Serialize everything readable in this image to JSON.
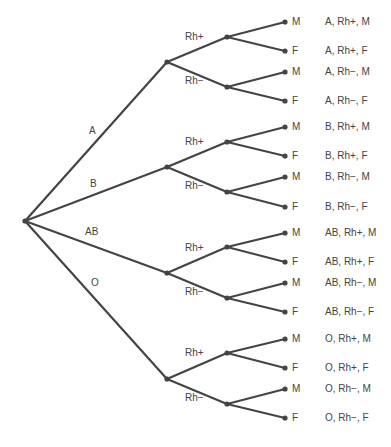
{
  "diagram": {
    "type": "tree",
    "root": {
      "x": 25,
      "y": 221
    },
    "line_color": "#444444",
    "groups": [
      {
        "label": "A",
        "label_pos": [
          89,
          131
        ],
        "node": [
          167,
          62
        ],
        "rh": [
          {
            "label": "Rh+",
            "label_pos": [
              185,
              37
            ],
            "node": [
              227,
              37
            ],
            "leaves": [
              {
                "sex": "M",
                "y": 22,
                "outcome": "A, Rh+, M"
              },
              {
                "sex": "F",
                "y": 51,
                "outcome": "A, Rh+, F"
              }
            ]
          },
          {
            "label": "Rh−",
            "label_pos": [
              185,
              81
            ],
            "node": [
              227,
              87
            ],
            "leaves": [
              {
                "sex": "M",
                "y": 72,
                "outcome": "A, Rh−, M"
              },
              {
                "sex": "F",
                "y": 101,
                "outcome": "A, Rh−, F"
              }
            ]
          }
        ]
      },
      {
        "label": "B",
        "label_pos": [
          90,
          184
        ],
        "node": [
          167,
          167
        ],
        "rh": [
          {
            "label": "Rh+",
            "label_pos": [
              185,
              142
            ],
            "node": [
              227,
              142
            ],
            "leaves": [
              {
                "sex": "M",
                "y": 127,
                "outcome": "B, Rh+, M"
              },
              {
                "sex": "F",
                "y": 156,
                "outcome": "B, Rh+, F"
              }
            ]
          },
          {
            "label": "Rh−",
            "label_pos": [
              185,
              186
            ],
            "node": [
              227,
              192
            ],
            "leaves": [
              {
                "sex": "M",
                "y": 177,
                "outcome": "B, Rh−, M"
              },
              {
                "sex": "F",
                "y": 207,
                "outcome": "B, Rh−, F"
              }
            ]
          }
        ]
      },
      {
        "label": "AB",
        "label_pos": [
          85,
          232
        ],
        "node": [
          167,
          273
        ],
        "rh": [
          {
            "label": "Rh+",
            "label_pos": [
              185,
              248
            ],
            "node": [
              227,
              247
            ],
            "leaves": [
              {
                "sex": "M",
                "y": 233,
                "outcome": "AB, Rh+, M"
              },
              {
                "sex": "F",
                "y": 262,
                "outcome": "AB, Rh+, F"
              }
            ]
          },
          {
            "label": "Rh−",
            "label_pos": [
              185,
              292
            ],
            "node": [
              227,
              298
            ],
            "leaves": [
              {
                "sex": "M",
                "y": 283,
                "outcome": "AB, Rh−, M"
              },
              {
                "sex": "F",
                "y": 312,
                "outcome": "AB, Rh−, F"
              }
            ]
          }
        ]
      },
      {
        "label": "O",
        "label_pos": [
          91,
          283
        ],
        "node": [
          167,
          379
        ],
        "rh": [
          {
            "label": "Rh+",
            "label_pos": [
              185,
              353
            ],
            "node": [
              227,
              353
            ],
            "leaves": [
              {
                "sex": "M",
                "y": 339,
                "outcome": "O, Rh+, M"
              },
              {
                "sex": "F",
                "y": 368,
                "outcome": "O, Rh+, F"
              }
            ]
          },
          {
            "label": "Rh−",
            "label_pos": [
              185,
              398
            ],
            "node": [
              227,
              404
            ],
            "leaves": [
              {
                "sex": "M",
                "y": 389,
                "outcome": "O, Rh−, M"
              },
              {
                "sex": "F",
                "y": 418,
                "outcome": "O, Rh−, F"
              }
            ]
          }
        ]
      }
    ],
    "leaf_x": 285,
    "sex_label_x": 292,
    "outcome_x": 325
  }
}
